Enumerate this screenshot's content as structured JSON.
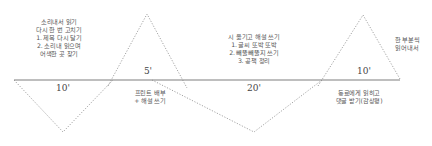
{
  "diagram": {
    "type": "lesson-flow-timeline",
    "colors": {
      "baseline": "#a9a9a9",
      "dotted": "#8a8a8a",
      "text": "#555555"
    },
    "segments": [
      {
        "label": "10'",
        "direction": "down"
      },
      {
        "label": "5'",
        "direction": "up"
      },
      {
        "label": "20'",
        "direction": "down"
      },
      {
        "label": "10'",
        "direction": "up"
      }
    ],
    "notes": {
      "segment1_above": {
        "lines": [
          "소리내서 읽기",
          "다시 한 번 고치기",
          "1. 제목 다시 달기",
          "2. 소리내 읽으며",
          "어색한 곳 찾기"
        ]
      },
      "segment2_below": {
        "lines": [
          "프린트 배부",
          "+ 해설 쓰기"
        ]
      },
      "segment3_above": {
        "lines": [
          "시 옮기고 해설 쓰기",
          "1. 글씨 또박 또박",
          "2. 빼뚤빼뚤지 쓰기",
          "3. 공책 정리"
        ]
      },
      "segment4_below": {
        "lines": [
          "동료에게 읽히고",
          "댓글 받기(감상평)"
        ]
      },
      "segment4_right": {
        "lines": [
          "한 부분씩",
          "읽어내서"
        ]
      }
    }
  }
}
